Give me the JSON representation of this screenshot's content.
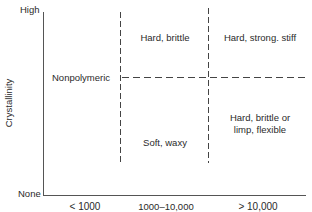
{
  "diagram": {
    "y_axis": {
      "label": "Crystallinity",
      "top_label": "High",
      "bottom_label": "None"
    },
    "x_axis": {
      "label": "Molecular weight",
      "categories": [
        "< 1000",
        "1000–10,000",
        "> 10,000"
      ]
    },
    "regions": {
      "nonpolymeric": "Nonpolymeric",
      "mid_high": "Hard, brittle",
      "mid_low": "Soft, waxy",
      "high_high": "Hard, strong. stiff",
      "high_low_line1": "Hard, brittle or",
      "high_low_line2": "limp, flexible"
    },
    "colors": {
      "line": "#444444",
      "text": "#2a2a2a",
      "background": "#ffffff"
    }
  }
}
